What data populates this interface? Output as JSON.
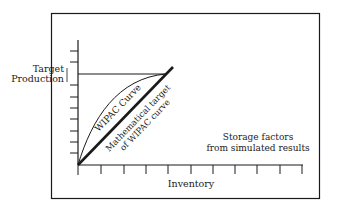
{
  "diagram": {
    "y_axis_label_line1": "Target",
    "y_axis_label_line2": "Production",
    "x_axis_label": "Inventory",
    "curve_label": "WIPAC Curve",
    "line_label_line1": "Mathematical target",
    "line_label_line2": "of WIPAC curve",
    "note_line1": "Storage factors",
    "note_line2": "from simulated results",
    "x_ticks": 11,
    "y_ticks": 10,
    "colors": {
      "line": "#1a1a1a",
      "background": "#ffffff"
    }
  }
}
